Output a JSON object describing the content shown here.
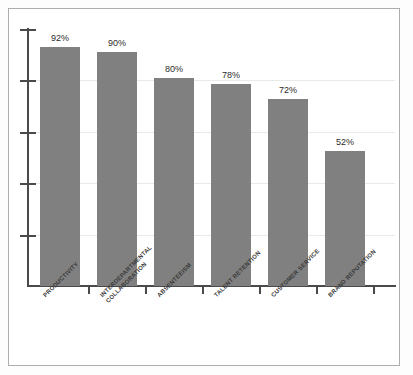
{
  "chart_data": {
    "type": "bar",
    "title": "",
    "subtitle": "",
    "xlabel": "",
    "ylabel": "",
    "ylim": [
      0,
      99
    ],
    "grid": true,
    "legend": false,
    "orientation": "vertical",
    "bar_color": "#808080",
    "categories": [
      "PRODUCTIVITY",
      "INTERDEPARTMENTAL COLLABORATION",
      "ABSENTEEISM",
      "TALENT RETENTION",
      "CUSTOMER SERVICE",
      "BRAND REPUTATION"
    ],
    "category_label_lines": [
      [
        "PRODUCTIVITY"
      ],
      [
        "INTERDEPARTMENTAL",
        "COLLABORATION"
      ],
      [
        "ABSENTEEISM"
      ],
      [
        "TALENT RETENTION"
      ],
      [
        "CUSTOMER SERVICE"
      ],
      [
        "BRAND REPUTATION"
      ]
    ],
    "values": [
      92,
      90,
      80,
      78,
      72,
      52
    ],
    "data_labels": [
      "92%",
      "90%",
      "80%",
      "78%",
      "72%",
      "52%"
    ],
    "y_tick_count": 5,
    "y_tick_labels": []
  },
  "colors": {
    "bar": "#808080",
    "axis": "#4a4a4a",
    "grid": "#e9e9e9",
    "frame": "#adadad",
    "label_text": "#3a3a3a",
    "value_text": "#2b2b2b",
    "background": "#ffffff"
  }
}
